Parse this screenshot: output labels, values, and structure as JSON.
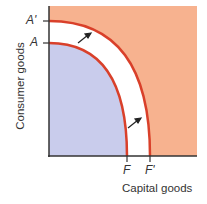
{
  "diagram": {
    "y_axis_label": "Consumer goods",
    "x_axis_label": "Capital goods",
    "y_ticks": [
      {
        "label": "A'",
        "note": "outer frontier intercept"
      },
      {
        "label": "A",
        "note": "inner frontier intercept"
      }
    ],
    "x_ticks": [
      {
        "label": "F",
        "note": "inner frontier intercept"
      },
      {
        "label": "F'",
        "note": "outer frontier intercept"
      }
    ],
    "curves": [
      {
        "name": "inner frontier AF",
        "from": "A",
        "to": "F"
      },
      {
        "name": "outer frontier A'F'",
        "from": "A'",
        "to": "F'"
      }
    ],
    "arrows": 2,
    "colors": {
      "inner_region": "#c9ccec",
      "outer_region": "#f7b28f",
      "curve": "#d9402a",
      "axis": "#333333"
    }
  }
}
